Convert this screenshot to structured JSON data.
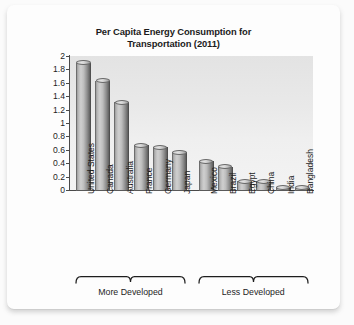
{
  "chart_data": {
    "type": "bar",
    "title": "Per Capita Energy Consumption for Transportation (2011)",
    "title_line1": "Per Capita Energy Consumption for",
    "title_line2": "Transportation (2011)",
    "xlabel": "",
    "ylabel": "Metric Tons of Oil Equivalent",
    "ylim": [
      0,
      2
    ],
    "ytick_labels": [
      "2",
      "1.8",
      "1.6",
      "1.4",
      "1.2",
      "1",
      "0.8",
      "0.6",
      "0.4",
      "0.2",
      "0"
    ],
    "ytick_values": [
      2,
      1.8,
      1.6,
      1.4,
      1.2,
      1,
      0.8,
      0.6,
      0.4,
      0.2,
      0
    ],
    "grid": false,
    "legend": "none",
    "bar_style": "3d-cylinder",
    "bar_color": "#b0b0b0",
    "categories": [
      "United States",
      "Canada",
      "Australia",
      "France",
      "Germany",
      "Japan",
      "Mexico",
      "Brazil",
      "Egypt",
      "China",
      "India",
      "Bangladesh"
    ],
    "values": [
      1.9,
      1.63,
      1.31,
      0.67,
      0.64,
      0.56,
      0.43,
      0.35,
      0.13,
      0.13,
      0.04,
      0.02
    ],
    "groups": [
      {
        "label": "More Developed",
        "categories": [
          "United States",
          "Canada",
          "Australia",
          "France",
          "Germany",
          "Japan"
        ]
      },
      {
        "label": "Less Developed",
        "categories": [
          "Mexico",
          "Brazil",
          "Egypt",
          "China",
          "India",
          "Bangladesh"
        ]
      }
    ]
  }
}
